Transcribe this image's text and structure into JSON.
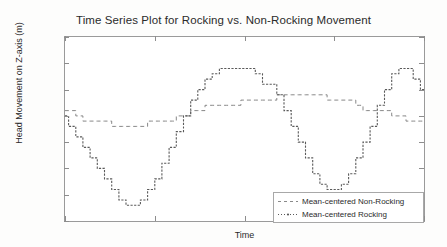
{
  "chart_data": {
    "type": "line",
    "title": "Time Series Plot for Rocking vs. Non-Rocking Movement",
    "xlabel": "Time",
    "ylabel": "Head Movement on Z-axis (m)",
    "ylim": [
      -0.2,
      0.15
    ],
    "xlim": [
      0,
      100
    ],
    "grid": false,
    "legend_position": "lower right",
    "ytick_labels": [
      "0.15",
      "0.1",
      "0.05",
      "0",
      "-0.05",
      "-0.1",
      "-0.15",
      "-0.2"
    ],
    "ytick_values": [
      0.15,
      0.1,
      0.05,
      0,
      -0.05,
      -0.1,
      -0.15,
      -0.2
    ],
    "xtick_labels": [
      "",
      "",
      "",
      "",
      ""
    ],
    "xtick_values": [
      0,
      25,
      50,
      75,
      100
    ],
    "series": [
      {
        "name": "Mean-centered Non-Rocking",
        "style": "dashed",
        "color": "#7b7b7b",
        "x": [
          0,
          2,
          4,
          6,
          8,
          10,
          12,
          14,
          16,
          18,
          20,
          22,
          24,
          26,
          28,
          30,
          32,
          34,
          36,
          38,
          40,
          42,
          44,
          46,
          48,
          50,
          52,
          54,
          56,
          58,
          60,
          62,
          64,
          66,
          68,
          70,
          72,
          74,
          76,
          78,
          80,
          82,
          84,
          86,
          88,
          90,
          92,
          94,
          96,
          98,
          100
        ],
        "y": [
          0.01,
          0.01,
          0.0,
          -0.01,
          -0.01,
          -0.01,
          -0.01,
          -0.02,
          -0.02,
          -0.02,
          -0.02,
          -0.02,
          -0.01,
          -0.01,
          -0.01,
          -0.01,
          0.0,
          0.0,
          0.01,
          0.01,
          0.02,
          0.02,
          0.02,
          0.02,
          0.02,
          0.03,
          0.03,
          0.03,
          0.03,
          0.03,
          0.04,
          0.04,
          0.04,
          0.04,
          0.04,
          0.04,
          0.04,
          0.03,
          0.03,
          0.03,
          0.03,
          0.02,
          0.01,
          0.01,
          0.01,
          0.01,
          0.0,
          0.0,
          -0.01,
          -0.01,
          -0.01
        ]
      },
      {
        "name": "Mean-centered Rocking",
        "style": "solid-dotted",
        "color": "#5a5a5a",
        "x": [
          0,
          2,
          4,
          6,
          8,
          10,
          12,
          14,
          16,
          18,
          20,
          22,
          24,
          26,
          28,
          30,
          32,
          34,
          36,
          38,
          40,
          42,
          44,
          46,
          48,
          50,
          52,
          54,
          56,
          58,
          60,
          62,
          64,
          66,
          68,
          70,
          72,
          74,
          76,
          78,
          80,
          82,
          84,
          86,
          88,
          90,
          92,
          94,
          96,
          98,
          100
        ],
        "y": [
          0.0,
          -0.02,
          -0.04,
          -0.06,
          -0.08,
          -0.1,
          -0.12,
          -0.14,
          -0.16,
          -0.17,
          -0.17,
          -0.16,
          -0.14,
          -0.12,
          -0.09,
          -0.06,
          -0.03,
          0.0,
          0.03,
          0.05,
          0.07,
          0.08,
          0.09,
          0.09,
          0.09,
          0.09,
          0.09,
          0.08,
          0.06,
          0.06,
          0.04,
          0.01,
          -0.02,
          -0.05,
          -0.08,
          -0.11,
          -0.13,
          -0.14,
          -0.14,
          -0.13,
          -0.11,
          -0.08,
          -0.05,
          -0.02,
          0.02,
          0.05,
          0.08,
          0.09,
          0.09,
          0.07,
          0.05
        ]
      }
    ]
  },
  "legend": {
    "entries": [
      {
        "label": "Mean-centered Non-Rocking"
      },
      {
        "label": "Mean-centered Rocking"
      }
    ]
  }
}
